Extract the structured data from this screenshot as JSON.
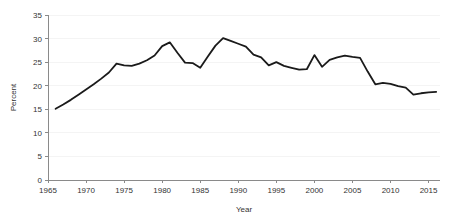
{
  "chart_data": {
    "type": "line",
    "title": "",
    "subtitle": "",
    "xlabel": "Year",
    "ylabel": "Percent",
    "xlim": [
      1965,
      2016.5
    ],
    "ylim": [
      0,
      35
    ],
    "grid": true,
    "legend": false,
    "legend_position": "none",
    "line_color": "#1a1a1a",
    "axis_color": "#8a8a8a",
    "grid_color": "#efefef",
    "xticks": [
      1965,
      1970,
      1975,
      1980,
      1985,
      1990,
      1995,
      2000,
      2005,
      2010,
      2015
    ],
    "xtick_labels": [
      "1965",
      "1970",
      "1975",
      "1980",
      "1985",
      "1990",
      "1995",
      "2000",
      "2005",
      "2010",
      "2015"
    ],
    "yticks": [
      0,
      5,
      10,
      15,
      20,
      25,
      30,
      35
    ],
    "ytick_labels": [
      "0",
      "5",
      "10",
      "15",
      "20",
      "25",
      "30",
      "35"
    ],
    "series": [
      {
        "name": "Percent",
        "x": [
          1966,
          1967,
          1968,
          1969,
          1970,
          1971,
          1972,
          1973,
          1974,
          1975,
          1976,
          1977,
          1978,
          1979,
          1980,
          1981,
          1982,
          1983,
          1984,
          1985,
          1986,
          1987,
          1988,
          1989,
          1990,
          1991,
          1992,
          1993,
          1994,
          1995,
          1996,
          1997,
          1998,
          1999,
          2000,
          2001,
          2002,
          2003,
          2004,
          2005,
          2006,
          2007,
          2008,
          2009,
          2010,
          2011,
          2012,
          2013,
          2014,
          2015,
          2016
        ],
        "values": [
          15.1,
          16.0,
          17.0,
          18.1,
          19.2,
          20.3,
          21.5,
          22.8,
          24.7,
          24.3,
          24.2,
          24.7,
          25.4,
          26.4,
          28.4,
          29.2,
          27.0,
          24.9,
          24.8,
          23.8,
          26.2,
          28.5,
          30.1,
          29.5,
          28.9,
          28.3,
          26.6,
          26.0,
          24.3,
          25.0,
          24.2,
          23.8,
          23.4,
          23.5,
          26.5,
          24.0,
          25.5,
          26.0,
          26.4,
          26.1,
          25.9,
          23.0,
          20.3,
          20.6,
          20.4,
          19.9,
          19.6,
          18.1,
          18.4,
          18.6,
          18.7
        ]
      }
    ]
  },
  "axes": {
    "y_axis_title": "Percent",
    "x_axis_title": "Year"
  }
}
